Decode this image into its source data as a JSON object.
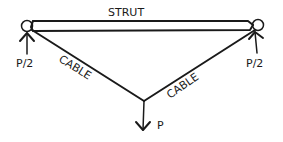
{
  "diagram": {
    "title": "",
    "labels": {
      "strut": "STRUT",
      "cable_left": "CABLE",
      "cable_right": "CABLE",
      "load": "P",
      "reaction_left": "P/2",
      "reaction_right": "P/2"
    },
    "components": [
      {
        "id": "strut",
        "type": "compression member",
        "label": "STRUT"
      },
      {
        "id": "cable-left",
        "type": "tension member",
        "label": "CABLE"
      },
      {
        "id": "cable-right",
        "type": "tension member",
        "label": "CABLE"
      },
      {
        "id": "support-left",
        "type": "pin support",
        "reaction": "P/2"
      },
      {
        "id": "support-right",
        "type": "pin support",
        "reaction": "P/2"
      },
      {
        "id": "load",
        "type": "applied load",
        "direction": "down",
        "label": "P"
      }
    ],
    "ink_color": "#1a1a1a",
    "background_color": "#ffffff"
  }
}
